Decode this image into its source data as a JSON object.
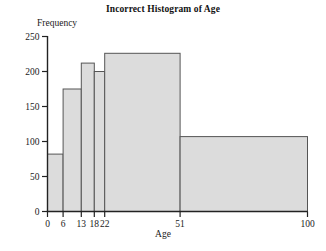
{
  "chart_data": {
    "type": "bar",
    "title": "Incorrect Histogram of Age",
    "xlabel": "Age",
    "ylabel": "Frequency",
    "xlim": [
      0,
      100
    ],
    "ylim": [
      0,
      250
    ],
    "grid": false,
    "legend": null,
    "bin_edges": [
      0,
      6,
      13,
      18,
      22,
      51,
      100
    ],
    "categories": [
      "0-6",
      "6-13",
      "13-18",
      "18-22",
      "22-51",
      "51-100"
    ],
    "values": [
      82,
      175,
      212,
      200,
      226,
      107
    ],
    "xticks": [
      0,
      6,
      13,
      18,
      22,
      51,
      100
    ],
    "xtick_labels": [
      "0",
      "6",
      "13",
      "18",
      "22",
      "51",
      "100"
    ],
    "yticks": [
      0,
      50,
      100,
      150,
      200,
      250
    ],
    "ytick_labels": [
      "0",
      "50",
      "100",
      "150",
      "200",
      "250"
    ],
    "bar_fill": "#dcdcdc",
    "bar_edge": "#555555",
    "axis_color": "#222222"
  },
  "axes": {
    "x_title": "Age",
    "y_title": "Frequency"
  },
  "title": {
    "text": "Incorrect Histogram of Age"
  }
}
